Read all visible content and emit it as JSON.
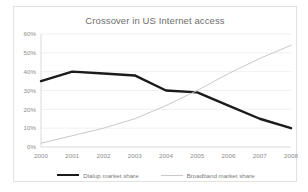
{
  "chart_data": {
    "type": "line",
    "title": "Crossover in US Internet access",
    "xlabel": "",
    "ylabel": "",
    "x": [
      "2000",
      "2001",
      "2002",
      "2003",
      "2004",
      "2005",
      "2006",
      "2007",
      "2008"
    ],
    "categories": [
      "2000",
      "2001",
      "2002",
      "2003",
      "2004",
      "2005",
      "2006",
      "2007",
      "2008"
    ],
    "ylim": [
      0,
      60
    ],
    "yticks": [
      0,
      10,
      20,
      30,
      40,
      50,
      60
    ],
    "ytick_labels": [
      "0%",
      "10%",
      "20%",
      "30%",
      "40%",
      "50%",
      "60%"
    ],
    "grid": true,
    "legend_position": "bottom",
    "series": [
      {
        "name": "Dialup market share",
        "color": "#1a1a1a",
        "width": 2.4,
        "values": [
          35,
          40,
          39,
          38,
          30,
          29,
          22,
          15,
          10
        ]
      },
      {
        "name": "Broadband market share",
        "color": "#c9c9c9",
        "width": 1.0,
        "values": [
          2,
          6,
          10,
          15,
          22,
          30,
          39,
          47,
          54
        ]
      }
    ]
  },
  "chart": {
    "title": "Crossover in US Internet access"
  },
  "legend": {
    "items": [
      {
        "label": "Dialup market share",
        "key": "dialup"
      },
      {
        "label": "Broadband market share",
        "key": "broadband"
      }
    ]
  },
  "colors": {
    "dialup": "#1a1a1a",
    "broadband": "#c9c9c9",
    "grid": "#e9e9e9",
    "axis": "#d0d0d0",
    "text": "#8c8c8c",
    "title": "#6e6e6e",
    "card_border": "#e2e2e2",
    "background": "#ffffff"
  }
}
